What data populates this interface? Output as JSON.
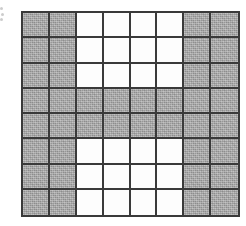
{
  "figure": {
    "edge_artifact": {
      "name": "cropped-label-dots",
      "visible": true
    }
  },
  "grid": {
    "rows": 8,
    "columns": 8,
    "total_cells": 64,
    "shaded_count": 44,
    "unshaded_count": 20,
    "colors": {
      "shaded": "#a9a9a9",
      "unshaded": "#fdfdfd",
      "gridline": "#3a3a3a",
      "background": "#ffffff"
    },
    "legend": {
      "shaded_label": "shaded",
      "unshaded_label": "unshaded"
    },
    "cells": [
      [
        "shaded",
        "shaded",
        "white",
        "white",
        "white",
        "white",
        "shaded",
        "shaded"
      ],
      [
        "shaded",
        "shaded",
        "white",
        "white",
        "white",
        "white",
        "shaded",
        "shaded"
      ],
      [
        "shaded",
        "shaded",
        "white",
        "white",
        "white",
        "white",
        "shaded",
        "shaded"
      ],
      [
        "shaded",
        "shaded",
        "shaded",
        "shaded",
        "shaded",
        "shaded",
        "shaded",
        "shaded"
      ],
      [
        "shaded",
        "shaded",
        "shaded",
        "shaded",
        "shaded",
        "shaded",
        "shaded",
        "shaded"
      ],
      [
        "shaded",
        "shaded",
        "white",
        "white",
        "white",
        "white",
        "shaded",
        "shaded"
      ],
      [
        "shaded",
        "shaded",
        "white",
        "white",
        "white",
        "white",
        "shaded",
        "shaded"
      ],
      [
        "shaded",
        "shaded",
        "white",
        "white",
        "white",
        "white",
        "shaded",
        "shaded"
      ]
    ]
  }
}
